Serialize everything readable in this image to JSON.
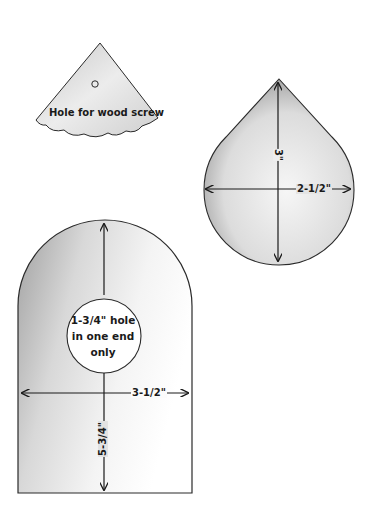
{
  "diagram": {
    "pieces": [
      {
        "id": "roof-cap",
        "shape": "triangle-with-scalloped-edge",
        "label": "Hole for wood screw"
      },
      {
        "id": "teardrop-piece",
        "shape": "teardrop",
        "dimensions": {
          "height": "3\"",
          "width": "2-1/2\""
        }
      },
      {
        "id": "front-back-panel",
        "shape": "arched-rectangle",
        "dimensions": {
          "width": "3-1/2\"",
          "height": "5-3/4\""
        },
        "hole_note": [
          "1-3/4\" hole",
          "in one end",
          "only"
        ]
      }
    ]
  },
  "colors": {
    "outline": "#2a2a2a",
    "shade_dark": "#8c8c8c",
    "shade_light": "#e6e6e6",
    "background": "#ffffff"
  }
}
